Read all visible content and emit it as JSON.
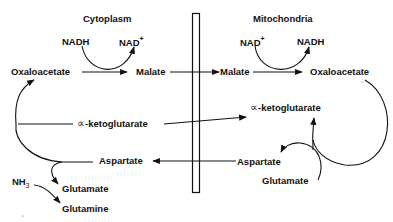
{
  "diagram": {
    "type": "malate-aspartate shuttle",
    "compartments": {
      "left": "Cytoplasm",
      "right": "Mitochondria"
    },
    "membrane": {
      "label": "",
      "x": 192,
      "y_top": 13,
      "y_bottom": 192
    },
    "cytoplasm": {
      "nadh": "NADH",
      "nad_base": "NAD",
      "nad_sup": "+",
      "oxaloacetate": "Oxaloacetate",
      "malate": "Malate",
      "alpha_symbol": "∝",
      "ketoglutarate": "-ketoglutarate",
      "aspartate": "Aspartate",
      "nh3_base": "NH",
      "nh3_sub": "3",
      "glutamate": "Glutamate",
      "glutamine": "Glutamine"
    },
    "mitochondria": {
      "nad_base": "NAD",
      "nad_sup": "+",
      "nadh": "NADH",
      "malate": "Malate",
      "oxaloacetate": "Oxaloacetate",
      "alpha_symbol": "∝",
      "ketoglutarate": "-ketoglutarate",
      "aspartate": "Aspartate",
      "glutamate": "Glutamate"
    },
    "colors": {
      "ink": "#111111",
      "background": "#ffffff"
    }
  }
}
